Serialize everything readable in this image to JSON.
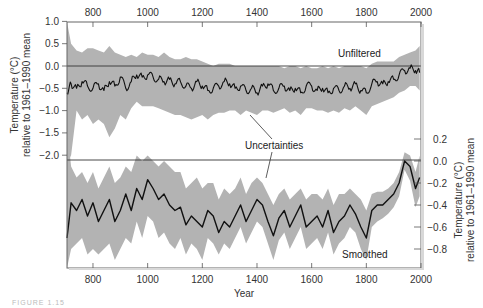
{
  "chart_data": [
    {
      "type": "line",
      "panel": "upper",
      "label": "Unfiltered",
      "band_label": "Uncertainties",
      "x_top_ticks": [
        800,
        1000,
        1200,
        1400,
        1600,
        1800,
        2000
      ],
      "xlim": [
        705,
        2000
      ],
      "ylabel": "Temperature (°C) relative to 1961–1990 mean",
      "ylabel_line1": "Temperature (°C)",
      "ylabel_line2": "relative to 1961–1990 mean",
      "y_ticks": [
        1.0,
        0.5,
        0.0,
        -0.5,
        -1.0,
        -1.5,
        -2.0
      ],
      "y_tick_labels": [
        "1.0",
        "0.5",
        "0.0",
        "−0.5",
        "−1.0",
        "−1.5",
        "−2.0"
      ],
      "reference_line": 0.0,
      "x": [
        705,
        720,
        740,
        760,
        780,
        800,
        820,
        840,
        860,
        880,
        900,
        920,
        940,
        960,
        980,
        1000,
        1020,
        1040,
        1060,
        1080,
        1100,
        1120,
        1140,
        1160,
        1180,
        1200,
        1220,
        1240,
        1260,
        1280,
        1300,
        1320,
        1340,
        1360,
        1380,
        1400,
        1420,
        1440,
        1460,
        1480,
        1500,
        1520,
        1540,
        1560,
        1580,
        1600,
        1620,
        1640,
        1660,
        1680,
        1700,
        1720,
        1740,
        1760,
        1780,
        1800,
        1820,
        1840,
        1860,
        1880,
        1900,
        1920,
        1940,
        1960,
        1980,
        1995
      ],
      "values": [
        -0.6,
        -0.4,
        -0.5,
        -0.35,
        -0.45,
        -0.5,
        -0.4,
        -0.55,
        -0.35,
        -0.45,
        -0.25,
        -0.5,
        -0.35,
        -0.2,
        -0.25,
        -0.2,
        -0.25,
        -0.3,
        -0.35,
        -0.3,
        -0.4,
        -0.35,
        -0.45,
        -0.5,
        -0.35,
        -0.45,
        -0.55,
        -0.5,
        -0.45,
        -0.35,
        -0.4,
        -0.5,
        -0.45,
        -0.55,
        -0.5,
        -0.6,
        -0.45,
        -0.4,
        -0.55,
        -0.5,
        -0.45,
        -0.55,
        -0.5,
        -0.6,
        -0.45,
        -0.45,
        -0.55,
        -0.5,
        -0.6,
        -0.5,
        -0.55,
        -0.45,
        -0.5,
        -0.4,
        -0.55,
        -0.6,
        -0.4,
        -0.35,
        -0.4,
        -0.35,
        -0.3,
        -0.2,
        -0.1,
        -0.05,
        -0.1,
        -0.15
      ],
      "upper": [
        1.0,
        0.5,
        0.35,
        0.3,
        0.4,
        0.4,
        0.35,
        0.3,
        0.45,
        0.3,
        0.25,
        0.2,
        0.25,
        0.2,
        0.3,
        0.25,
        0.25,
        0.2,
        0.3,
        0.2,
        0.15,
        0.15,
        0.2,
        0.15,
        0.15,
        0.1,
        0.05,
        0.0,
        0.05,
        0.05,
        0.05,
        0.0,
        0.0,
        0.0,
        0.0,
        0.0,
        0.0,
        0.0,
        0.0,
        0.0,
        -0.05,
        0.0,
        0.0,
        -0.05,
        0.0,
        -0.05,
        -0.05,
        0.0,
        -0.05,
        0.0,
        -0.05,
        0.0,
        0.0,
        0.0,
        0.0,
        -0.05,
        0.05,
        0.1,
        0.1,
        0.1,
        0.1,
        0.2,
        0.25,
        0.3,
        0.35,
        0.45
      ],
      "lower": [
        -2.2,
        -2.0,
        -1.0,
        -1.2,
        -1.1,
        -1.3,
        -1.2,
        -1.3,
        -1.6,
        -1.4,
        -1.1,
        -1.2,
        -0.95,
        -0.8,
        -0.9,
        -0.9,
        -0.9,
        -0.95,
        -1.0,
        -1.05,
        -1.1,
        -1.1,
        -1.15,
        -1.2,
        -1.15,
        -1.1,
        -1.2,
        -1.1,
        -1.05,
        -1.05,
        -1.0,
        -1.0,
        -1.1,
        -1.0,
        -1.05,
        -1.1,
        -1.0,
        -1.0,
        -1.05,
        -1.0,
        -0.95,
        -1.05,
        -1.0,
        -1.1,
        -0.95,
        -0.95,
        -1.0,
        -1.0,
        -1.05,
        -1.0,
        -1.05,
        -0.95,
        -1.0,
        -0.9,
        -1.0,
        -1.1,
        -0.9,
        -0.85,
        -0.8,
        -0.75,
        -0.7,
        -0.6,
        -0.55,
        -0.45,
        -0.45,
        -0.55
      ]
    },
    {
      "type": "line",
      "panel": "lower",
      "label": "Smoothed",
      "band_label": "Uncertainties",
      "x_bottom_ticks": [
        800,
        1000,
        1200,
        1400,
        1600,
        1800,
        2000
      ],
      "xlabel": "Year",
      "xlim": [
        705,
        2000
      ],
      "ylabel": "Temperature (°C) relative to 1961–1990 mean",
      "ylabel_line1": "Temperature (°C)",
      "ylabel_line2": "relative to 1961–1990 mean",
      "y_ticks": [
        0.2,
        0.0,
        -0.2,
        -0.4,
        -0.6,
        -0.8
      ],
      "y_tick_labels": [
        "0.2",
        "0.0",
        "−0.2",
        "−0.4",
        "−0.6",
        "−0.8"
      ],
      "reference_line": 0.0,
      "x": [
        705,
        720,
        740,
        760,
        780,
        800,
        820,
        840,
        860,
        880,
        900,
        920,
        940,
        960,
        980,
        1000,
        1020,
        1040,
        1060,
        1080,
        1100,
        1120,
        1140,
        1160,
        1180,
        1200,
        1220,
        1240,
        1260,
        1280,
        1300,
        1320,
        1340,
        1360,
        1380,
        1400,
        1420,
        1440,
        1460,
        1480,
        1500,
        1520,
        1540,
        1560,
        1580,
        1600,
        1620,
        1640,
        1660,
        1680,
        1700,
        1720,
        1740,
        1760,
        1780,
        1800,
        1820,
        1840,
        1860,
        1880,
        1900,
        1920,
        1940,
        1960,
        1980,
        1995
      ],
      "values": [
        -0.7,
        -0.38,
        -0.45,
        -0.35,
        -0.5,
        -0.38,
        -0.55,
        -0.45,
        -0.35,
        -0.55,
        -0.45,
        -0.3,
        -0.45,
        -0.25,
        -0.35,
        -0.17,
        -0.25,
        -0.35,
        -0.3,
        -0.4,
        -0.45,
        -0.42,
        -0.58,
        -0.5,
        -0.55,
        -0.6,
        -0.45,
        -0.5,
        -0.65,
        -0.55,
        -0.6,
        -0.5,
        -0.4,
        -0.55,
        -0.45,
        -0.35,
        -0.4,
        -0.55,
        -0.68,
        -0.52,
        -0.45,
        -0.6,
        -0.5,
        -0.4,
        -0.6,
        -0.55,
        -0.5,
        -0.6,
        -0.45,
        -0.65,
        -0.55,
        -0.5,
        -0.4,
        -0.48,
        -0.6,
        -0.7,
        -0.45,
        -0.4,
        -0.4,
        -0.35,
        -0.3,
        -0.2,
        0.0,
        -0.05,
        -0.25,
        -0.15
      ],
      "upper": [
        0.3,
        -0.05,
        -0.15,
        -0.1,
        -0.2,
        -0.1,
        -0.25,
        -0.15,
        -0.05,
        -0.2,
        -0.15,
        -0.05,
        -0.1,
        0.05,
        0.0,
        0.05,
        0.0,
        -0.05,
        0.0,
        -0.05,
        -0.1,
        -0.1,
        -0.25,
        -0.2,
        -0.15,
        -0.25,
        -0.2,
        -0.2,
        -0.35,
        -0.25,
        -0.3,
        -0.25,
        -0.15,
        -0.3,
        -0.2,
        -0.15,
        -0.2,
        -0.3,
        -0.4,
        -0.3,
        -0.25,
        -0.35,
        -0.3,
        -0.25,
        -0.35,
        -0.3,
        -0.3,
        -0.35,
        -0.25,
        -0.4,
        -0.3,
        -0.3,
        -0.25,
        -0.3,
        -0.35,
        -0.45,
        -0.3,
        -0.28,
        -0.28,
        -0.25,
        -0.2,
        -0.1,
        0.08,
        0.05,
        -0.1,
        0.05
      ],
      "lower": [
        -1.1,
        -0.8,
        -0.75,
        -0.7,
        -0.85,
        -0.8,
        -0.85,
        -0.8,
        -0.75,
        -0.9,
        -0.8,
        -0.7,
        -0.75,
        -0.55,
        -0.7,
        -0.5,
        -0.55,
        -0.7,
        -0.65,
        -0.75,
        -0.8,
        -0.7,
        -0.85,
        -0.75,
        -0.8,
        -0.9,
        -0.7,
        -0.75,
        -0.85,
        -0.75,
        -0.8,
        -0.7,
        -0.6,
        -0.75,
        -0.65,
        -0.55,
        -0.6,
        -0.75,
        -0.9,
        -0.72,
        -0.65,
        -0.8,
        -0.7,
        -0.6,
        -0.8,
        -0.75,
        -0.7,
        -0.8,
        -0.65,
        -0.85,
        -0.75,
        -0.7,
        -0.6,
        -0.65,
        -0.8,
        -0.9,
        -0.6,
        -0.55,
        -0.52,
        -0.48,
        -0.42,
        -0.32,
        -0.08,
        -0.18,
        -0.42,
        -0.32
      ]
    }
  ],
  "annotations": {
    "unfiltered": "Unfiltered",
    "uncertainties": "Uncertainties",
    "smoothed": "Smoothed",
    "xlabel": "Year",
    "left_ylabel_line1": "Temperature (°C)",
    "left_ylabel_line2": "relative to 1961–1990 mean",
    "right_ylabel_line1": "Temperature (°C)",
    "right_ylabel_line2": "relative to 1961–1990 mean",
    "caption": "FIGURE 1.15"
  },
  "colors": {
    "band": "#b3b3b3",
    "line": "#111111",
    "frame": "#555555",
    "reference": "#333333"
  }
}
